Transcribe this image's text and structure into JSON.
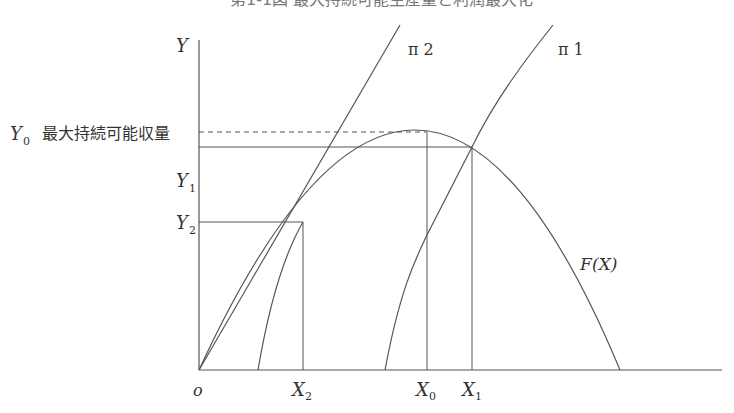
{
  "title": {
    "text": "第1-1図 最大持続可能生産量と利潤最大化",
    "visible": "partially clipped at top"
  },
  "axes": {
    "y_label": "Y",
    "x_origin_label": "o",
    "y_ticks": [
      {
        "name": "Y0",
        "base": "Y",
        "sub": "0",
        "note": "最大持続可能収量"
      },
      {
        "name": "Y1",
        "base": "Y",
        "sub": "1"
      },
      {
        "name": "Y2",
        "base": "Y",
        "sub": "2"
      }
    ],
    "x_ticks": [
      {
        "name": "X2",
        "base": "X",
        "sub": "2"
      },
      {
        "name": "X0",
        "base": "X",
        "sub": "0"
      },
      {
        "name": "X1",
        "base": "X",
        "sub": "1"
      }
    ]
  },
  "labels": {
    "y0_note": "最大持続可能収量",
    "pi2": "π 2",
    "pi1": "π 1",
    "fx": "F(X)",
    "fx_base": "F",
    "fx_arg": "(X)"
  },
  "geometry": {
    "origin": [
      199,
      370
    ],
    "y_axis_top": 40,
    "x_axis_right": 722,
    "peak": [
      427,
      132
    ],
    "f_right_root": 620,
    "y1_level": 147,
    "y2_level": 222,
    "x2_pos": 303,
    "x0_pos": 427,
    "x1_pos": 472,
    "pi2_line": {
      "from": [
        199,
        370
      ],
      "to": [
        400,
        25
      ]
    },
    "pi2_curve_start": 258,
    "pi1_curve_start": 385,
    "pi1_top": [
      553,
      25
    ]
  },
  "colors": {
    "line": "#555555",
    "text": "#333333",
    "background": "#ffffff"
  }
}
